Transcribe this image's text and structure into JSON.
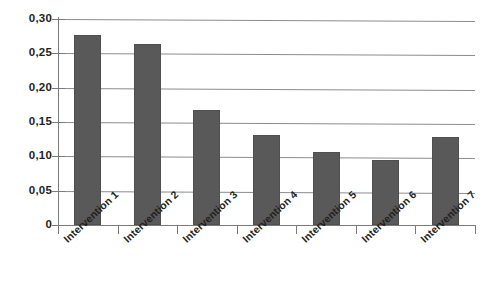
{
  "chart_data": {
    "type": "bar",
    "title": "",
    "subtitle": "",
    "xlabel": "",
    "ylabel": "",
    "categories": [
      "Intervention 1",
      "Intervention 2",
      "Intervention 3",
      "Intervention 4",
      "Intervention 5",
      "Intervention 6",
      "Intervention 7"
    ],
    "values": [
      0.277,
      0.264,
      0.167,
      0.131,
      0.107,
      0.094,
      0.128
    ],
    "ylim": [
      0,
      0.3
    ],
    "ytick_values": [
      0,
      0.05,
      0.1,
      0.15,
      0.2,
      0.25,
      0.3
    ],
    "ytick_labels": [
      "0",
      "0,05",
      "0,10",
      "0,15",
      "0,20",
      "0,25",
      "0,30"
    ],
    "decimal_separator": ",",
    "grid": "horizontal",
    "legend": "none",
    "bar_color": "#595959",
    "gridline_color": "#8c8c8c",
    "axis_color": "#7a7a7a",
    "label_color": "#231f20",
    "background_color": "#ffffff",
    "xtick_label_rotation": -43
  }
}
